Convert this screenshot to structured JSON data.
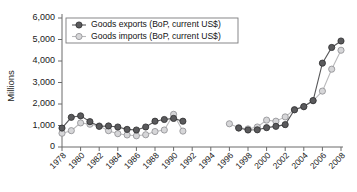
{
  "chart_data": {
    "type": "line",
    "title": "",
    "xlabel": "",
    "ylabel": "Millions",
    "xlim": [
      1977,
      2009
    ],
    "ylim": [
      0,
      6000
    ],
    "grid": false,
    "legend_position": "top-left",
    "x_ticks": [
      "1978",
      "1980",
      "1982",
      "1984",
      "1986",
      "1988",
      "1990",
      "1992",
      "1994",
      "1996",
      "1998",
      "2000",
      "2002",
      "2004",
      "2006",
      "2008"
    ],
    "y_ticks": [
      "0",
      "1,000",
      "2,000",
      "3,000",
      "4,000",
      "5,000",
      "6,000"
    ],
    "y_tick_values": [
      0,
      1000,
      2000,
      3000,
      4000,
      5000,
      6000
    ],
    "series": [
      {
        "name": "Goods exports (BoP, current US$)",
        "color": "#5a5a5c",
        "marker": "filled-circle",
        "x": [
          1978,
          1979,
          1980,
          1981,
          1982,
          1983,
          1984,
          1985,
          1986,
          1987,
          1988,
          1989,
          1990,
          1991,
          1996,
          1997,
          1998,
          1999,
          2000,
          2001,
          2002,
          2003,
          2004,
          2005,
          2006,
          2007
        ],
        "values": [
          880,
          1380,
          1450,
          1180,
          960,
          980,
          930,
          820,
          790,
          930,
          1200,
          1280,
          1330,
          1200,
          null,
          880,
          790,
          800,
          900,
          960,
          1040,
          1730,
          1880,
          2160,
          3900,
          4630
        ]
      },
      {
        "name": "Goods imports (BoP, current US$)",
        "color": "#d6d6d8",
        "marker": "open-circle",
        "x": [
          1978,
          1979,
          1980,
          1981,
          1982,
          1983,
          1984,
          1985,
          1986,
          1987,
          1988,
          1989,
          1990,
          1991,
          1996,
          1997,
          1998,
          1999,
          2000,
          2001,
          2002,
          2003,
          2004,
          2005,
          2006,
          2007
        ],
        "values": [
          640,
          760,
          1120,
          1060,
          980,
          760,
          620,
          560,
          520,
          570,
          720,
          790,
          1520,
          740,
          1080,
          900,
          840,
          930,
          1250,
          1200,
          1400,
          1740,
          1870,
          2150,
          2600,
          3620
        ]
      }
    ],
    "exports_2008": 4930,
    "imports_2008": 4500
  },
  "legend": {
    "items": [
      {
        "label": "Goods exports (BoP, current US$)",
        "marker": "filled-circle"
      },
      {
        "label": "Goods imports (BoP, current US$)",
        "marker": "open-circle"
      }
    ]
  },
  "colors": {
    "exports_fill": "#5a5a5c",
    "exports_stroke": "#2e2e30",
    "imports_fill": "#d6d6d8",
    "imports_stroke": "#8d8d90",
    "axis": "#6b6b6b",
    "text": "#141414",
    "background": "#ffffff"
  }
}
